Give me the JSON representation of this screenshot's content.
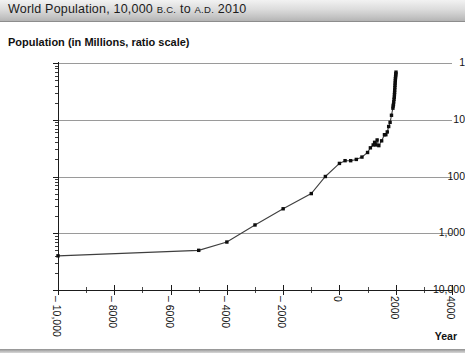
{
  "titlebar": {
    "prefix": "World Population, 10,000 ",
    "bc": "B.C.",
    "middle": " to ",
    "ad": "A.D.",
    "suffix": " 2010"
  },
  "subtitle": "Population (in Millions, ratio scale)",
  "axis": {
    "x_title": "Year",
    "y_labels": [
      "10,000",
      "1,000",
      "100",
      "10",
      "1"
    ],
    "x_labels": [
      "– 10,000",
      "– 8000",
      "– 6000",
      "– 4000",
      "– 2000",
      "0",
      "2000",
      "4000"
    ]
  },
  "colors": {
    "grid": "#9a9a9a",
    "axis": "#1b1b1b",
    "marker": "#0d0d0d",
    "line": "#3f3f3f",
    "titlebar_top": "#f2f2f2",
    "titlebar_bottom": "#b4b4b4"
  },
  "chart_data": {
    "type": "line",
    "title": "World Population, 10,000 B.C. to A.D. 2010",
    "xlabel": "Year",
    "ylabel": "Population (in Millions, ratio scale)",
    "yscale": "log",
    "ylim": [
      1,
      10000
    ],
    "xlim": [
      -10000,
      4000
    ],
    "ytick_values": [
      1,
      10,
      100,
      1000,
      10000
    ],
    "ytick_labels": [
      "1",
      "10",
      "100",
      "1,000",
      "10,000"
    ],
    "xtick_values": [
      -10000,
      -8000,
      -6000,
      -4000,
      -2000,
      0,
      2000,
      4000
    ],
    "xtick_labels": [
      "– 10,000",
      "– 8000",
      "– 6000",
      "– 4000",
      "– 2000",
      "0",
      "2000",
      "4000"
    ],
    "grid": true,
    "legend": "none",
    "markers": true,
    "series": [
      {
        "name": "World population (millions)",
        "x": [
          -10000,
          -5000,
          -4000,
          -3000,
          -2000,
          -1000,
          -500,
          0,
          200,
          400,
          600,
          800,
          1000,
          1100,
          1200,
          1250,
          1300,
          1340,
          1400,
          1500,
          1600,
          1650,
          1700,
          1750,
          1800,
          1850,
          1900,
          1910,
          1920,
          1930,
          1940,
          1950,
          1955,
          1960,
          1965,
          1970,
          1975,
          1980,
          1985,
          1990,
          1995,
          2000,
          2005,
          2010
        ],
        "y": [
          4,
          5,
          7,
          14,
          27,
          50,
          100,
          170,
          190,
          190,
          200,
          220,
          265,
          320,
          360,
          400,
          360,
          440,
          350,
          425,
          545,
          545,
          610,
          760,
          900,
          1200,
          1600,
          1750,
          1860,
          2070,
          2300,
          2500,
          2770,
          3030,
          3340,
          3700,
          4070,
          4440,
          4850,
          5290,
          5700,
          6090,
          6470,
          6900
        ]
      }
    ]
  }
}
